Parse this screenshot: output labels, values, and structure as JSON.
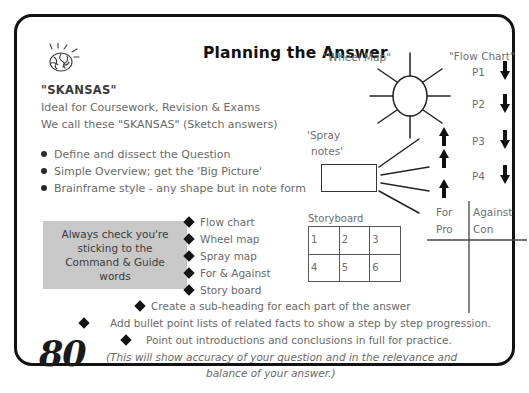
{
  "page": {
    "number": "80"
  },
  "header": {
    "title": "Planning the Answer",
    "doodle_icon": "brain-doodle-icon"
  },
  "intro": {
    "heading": "\"SKANSAS\"",
    "line1": "Ideal for Coursework, Revision & Exams",
    "line2": "We call these \"SKANSAS\" (Sketch answers)"
  },
  "key_points": [
    "Define and dissect the Question",
    "Simple Overview; get the 'Big Picture'",
    "Brainframe style - any shape but in note form"
  ],
  "command_box": {
    "lines": [
      "Always check you're",
      "sticking to the",
      "Command & Guide",
      "words"
    ],
    "background": "#c8c8c8"
  },
  "method_list": [
    "Flow chart",
    "Wheel map",
    "Spray map",
    "For & Against",
    "Story board"
  ],
  "bottom_points": [
    "Create a sub-heading for each part of the answer",
    "Add bullet point lists of related facts to show a step by step progression.",
    "Point out introductions and conclusions in full for practice."
  ],
  "closing_note": {
    "line1": "(This will show accuracy of your question and in the relevance and",
    "line2": "balance of your answer.)"
  },
  "diagrams": {
    "wheel_map": {
      "label": "\"Wheel Map\"",
      "spokes": 8
    },
    "spray_notes": {
      "label_line1": "'Spray",
      "label_line2": "notes'",
      "rays": 4
    },
    "storyboard": {
      "caption": "Storyboard",
      "cells": [
        "1",
        "2",
        "3",
        "4",
        "5",
        "6"
      ]
    },
    "flow_chart": {
      "label": "\"Flow Chart\"",
      "steps": [
        "P1",
        "P2",
        "P3",
        "P4"
      ],
      "down_arrows": 4,
      "up_arrows": 3,
      "arrow_down_glyph": "arrow-down-icon",
      "arrow_up_glyph": "arrow-up-icon"
    },
    "for_against": {
      "left_top": "For",
      "left_bottom": "Pro",
      "right_top": "Against",
      "right_bottom": "Con"
    }
  },
  "colors": {
    "ink": "#6a6a6a",
    "dark_ink": "#2b2b2b",
    "border": "#121212",
    "grey_panel": "#c8c8c8"
  }
}
